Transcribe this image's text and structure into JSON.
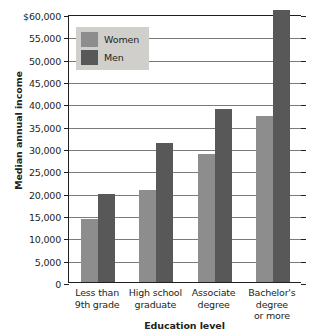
{
  "chart_data": {
    "type": "bar",
    "title": "",
    "xlabel": "Education level",
    "ylabel": "Median annual income",
    "categories": [
      "Less than\n9th grade",
      "High school\ngraduate",
      "Associate\ndegree",
      "Bachelor's\ndegree\nor more"
    ],
    "series": [
      {
        "name": "Women",
        "color": "#8d8d8d",
        "values": [
          14000,
          20700,
          28700,
          37200
        ]
      },
      {
        "name": "Men",
        "color": "#585858",
        "values": [
          19800,
          31100,
          38800,
          61000
        ]
      }
    ],
    "ylim": [
      0,
      60000
    ],
    "ytick_step": 5000,
    "ytick_labels": [
      "$60,000",
      "55,000",
      "50,000",
      "45,000",
      "40,000",
      "35,000",
      "30,000",
      "25,000",
      "20,000",
      "15,000",
      "10,000",
      "5,000",
      "0"
    ],
    "ytick_values": [
      60000,
      55000,
      50000,
      45000,
      40000,
      35000,
      30000,
      25000,
      20000,
      15000,
      10000,
      5000,
      0
    ],
    "grid": true,
    "legend_position": "top-left"
  },
  "legend": {
    "entries": [
      {
        "label": "Women",
        "color": "#8d8d8d"
      },
      {
        "label": "Men",
        "color": "#585858"
      }
    ]
  },
  "axes": {
    "x_title": "Education level",
    "y_title": "Median annual income"
  }
}
